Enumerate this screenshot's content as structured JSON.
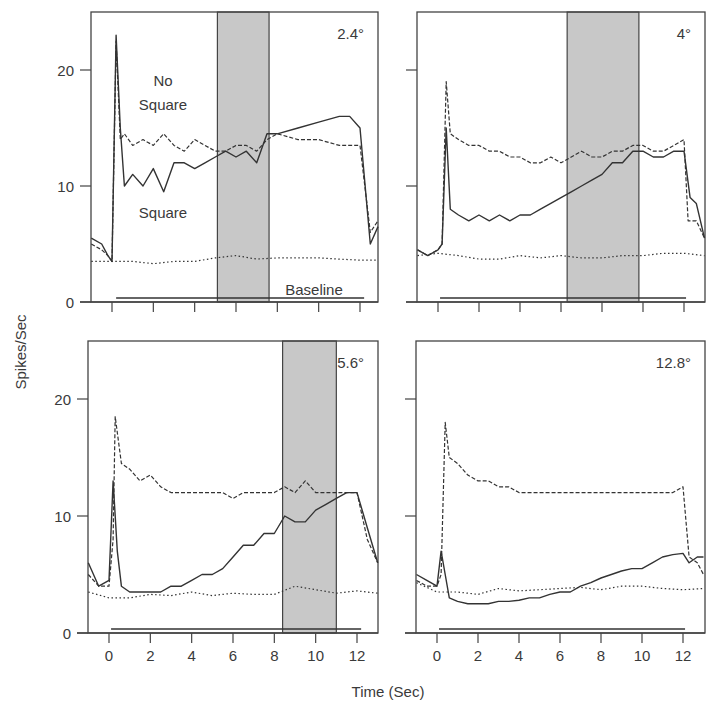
{
  "figure": {
    "ylabel": "Spikes/Sec",
    "xlabel": "Time (Sec)",
    "colors": {
      "line": "#333333",
      "shade": "#c8c8c8",
      "frame": "#444444"
    }
  },
  "chart_data": [
    {
      "type": "line",
      "title": "2.4°",
      "xlabel": "Time (Sec)",
      "ylabel": "Spikes/Sec",
      "xlim": [
        -1,
        13
      ],
      "ylim": [
        0,
        25
      ],
      "xticks": [
        0,
        2,
        4,
        6,
        8,
        10,
        12
      ],
      "yticks": [
        0,
        10,
        20
      ],
      "shaded_interval": [
        5.1,
        7.6
      ],
      "stimulus_bar": [
        0.2,
        12.2
      ],
      "annotations": [
        "No Square",
        "Square",
        "Baseline"
      ],
      "series": [
        {
          "name": "No Square",
          "style": "dashed",
          "x": [
            -1,
            -0.5,
            -0.2,
            0,
            0.2,
            0.4,
            0.6,
            1,
            1.5,
            2,
            2.5,
            3,
            3.5,
            4,
            4.5,
            5,
            5.5,
            6,
            6.5,
            7,
            7.5,
            8,
            9,
            10,
            11,
            12,
            12.5,
            13
          ],
          "y": [
            5,
            4.5,
            4,
            3.5,
            22.5,
            14,
            14.5,
            13.5,
            14,
            13.5,
            14.5,
            13.5,
            13,
            14,
            13.5,
            13,
            13,
            13.5,
            13.5,
            13,
            14,
            14.5,
            14,
            14,
            13.5,
            13.5,
            6,
            7
          ]
        },
        {
          "name": "Square",
          "style": "solid",
          "x": [
            -1,
            -0.5,
            -0.2,
            0,
            0.2,
            0.4,
            0.6,
            1,
            1.5,
            2,
            2.5,
            3,
            3.5,
            4,
            4.5,
            5,
            5.5,
            6,
            6.5,
            7,
            7.5,
            8,
            9,
            10,
            11,
            11.5,
            12,
            12.5,
            13
          ],
          "y": [
            5.5,
            5,
            4,
            3.5,
            23,
            15,
            10,
            11,
            10,
            11.5,
            9.5,
            12,
            12,
            11.5,
            12,
            12.5,
            13,
            12.5,
            13,
            12,
            14.5,
            14.5,
            15,
            15.5,
            16,
            16,
            15,
            5,
            6.5
          ]
        },
        {
          "name": "Baseline",
          "style": "dotted",
          "x": [
            -1,
            0,
            1,
            2,
            3,
            4,
            5,
            6,
            7,
            8,
            9,
            10,
            11,
            12,
            13
          ],
          "y": [
            3.5,
            3.5,
            3.5,
            3.3,
            3.5,
            3.5,
            3.8,
            4,
            3.7,
            3.8,
            3.8,
            3.8,
            3.7,
            3.6,
            3.6
          ]
        }
      ]
    },
    {
      "type": "line",
      "title": "4°",
      "xlim": [
        -1,
        13
      ],
      "ylim": [
        0,
        25
      ],
      "xticks": [
        0,
        2,
        4,
        6,
        8,
        10,
        12
      ],
      "yticks": [
        0,
        10,
        20
      ],
      "shaded_interval": [
        6.3,
        9.8
      ],
      "stimulus_bar": [
        0.1,
        12.1
      ],
      "series": [
        {
          "name": "No Square",
          "style": "dashed",
          "x": [
            -1,
            -0.5,
            0,
            0.2,
            0.4,
            0.6,
            1,
            1.5,
            2,
            2.5,
            3,
            3.5,
            4,
            4.5,
            5,
            5.5,
            6,
            6.5,
            7,
            7.5,
            8,
            8.5,
            9,
            9.5,
            10,
            10.5,
            11,
            11.5,
            12,
            12.2,
            12.6,
            13
          ],
          "y": [
            4.5,
            4,
            4.5,
            5,
            19,
            14.5,
            14,
            13.5,
            13.5,
            13,
            13,
            12.5,
            12.5,
            12,
            12,
            12.5,
            12,
            12.5,
            13,
            12.5,
            12.5,
            13,
            13,
            13.5,
            13.5,
            13,
            13,
            13.5,
            14,
            7,
            7,
            5.5
          ]
        },
        {
          "name": "Square",
          "style": "solid",
          "x": [
            -1,
            -0.5,
            0,
            0.2,
            0.4,
            0.6,
            1,
            1.5,
            2,
            2.5,
            3,
            3.5,
            4,
            4.5,
            5,
            5.5,
            6,
            6.5,
            7,
            7.5,
            8,
            8.5,
            9,
            9.5,
            10,
            10.5,
            11,
            11.5,
            12,
            12.3,
            12.6,
            13
          ],
          "y": [
            4.5,
            4,
            4.5,
            5,
            15,
            8,
            7.5,
            7,
            7.5,
            7,
            7.5,
            7,
            7.5,
            7.5,
            8,
            8.5,
            9,
            9.5,
            10,
            10.5,
            11,
            12,
            12,
            13,
            13,
            12.5,
            12.5,
            13,
            13,
            9,
            8.5,
            5.5
          ]
        },
        {
          "name": "Baseline",
          "style": "dotted",
          "x": [
            -1,
            0,
            1,
            2,
            3,
            4,
            5,
            6,
            7,
            8,
            9,
            10,
            11,
            12,
            13
          ],
          "y": [
            4,
            4.2,
            4,
            3.7,
            3.7,
            4,
            3.8,
            4,
            3.8,
            3.8,
            4,
            4,
            4.2,
            4.2,
            4
          ]
        }
      ]
    },
    {
      "type": "line",
      "title": "5.6°",
      "xlim": [
        -1,
        13
      ],
      "ylim": [
        0,
        25
      ],
      "xticks": [
        0,
        2,
        4,
        6,
        8,
        10,
        12
      ],
      "yticks": [
        0,
        10,
        20
      ],
      "shaded_interval": [
        8.4,
        11.0
      ],
      "stimulus_bar": [
        0.1,
        12.2
      ],
      "series": [
        {
          "name": "No Square",
          "style": "dashed",
          "x": [
            -1,
            -0.5,
            0,
            0.2,
            0.3,
            0.6,
            1,
            1.5,
            2,
            2.5,
            3,
            3.5,
            4,
            4.5,
            5,
            5.5,
            6,
            6.5,
            7,
            7.5,
            8,
            8.5,
            9,
            9.5,
            10,
            10.5,
            11,
            11.5,
            12,
            12.5,
            13
          ],
          "y": [
            5,
            4,
            4,
            8,
            18.5,
            14.5,
            14,
            13,
            13.5,
            12.5,
            12,
            12,
            12,
            12,
            12,
            12,
            11.5,
            12,
            12,
            12,
            12,
            12.5,
            12,
            13,
            12,
            12,
            12,
            12,
            12,
            8,
            6
          ]
        },
        {
          "name": "Square",
          "style": "solid",
          "x": [
            -1,
            -0.5,
            0,
            0.2,
            0.4,
            0.6,
            1,
            1.5,
            2,
            2.5,
            3,
            3.5,
            4,
            4.5,
            5,
            5.5,
            6,
            6.5,
            7,
            7.5,
            8,
            8.5,
            9,
            9.5,
            10,
            10.5,
            11,
            11.5,
            12,
            12.5,
            13
          ],
          "y": [
            6,
            4,
            4.5,
            13,
            7,
            4,
            3.5,
            3.5,
            3.5,
            3.5,
            4,
            4,
            4.5,
            5,
            5,
            5.5,
            6.5,
            7.5,
            7.5,
            8.5,
            8.5,
            10,
            9.5,
            9.5,
            10.5,
            11,
            11.5,
            12,
            12,
            9,
            6
          ]
        },
        {
          "name": "Baseline",
          "style": "dotted",
          "x": [
            -1,
            0,
            1,
            2,
            3,
            4,
            5,
            6,
            7,
            8,
            9,
            10,
            11,
            12,
            13
          ],
          "y": [
            3.5,
            3,
            3,
            3.3,
            3.2,
            3.5,
            3.2,
            3.4,
            3.3,
            3.3,
            4,
            3.7,
            3.4,
            3.6,
            3.4
          ]
        }
      ]
    },
    {
      "type": "line",
      "title": "12.8°",
      "xlim": [
        -1,
        13
      ],
      "ylim": [
        0,
        25
      ],
      "xticks": [
        0,
        2,
        4,
        6,
        8,
        10,
        12
      ],
      "yticks": [
        0,
        10,
        20
      ],
      "stimulus_bar": [
        0.1,
        12.1
      ],
      "series": [
        {
          "name": "No Square",
          "style": "dashed",
          "x": [
            -1,
            -0.5,
            0,
            0.2,
            0.4,
            0.6,
            1,
            1.5,
            2,
            2.5,
            3,
            3.5,
            4,
            4.5,
            5,
            5.5,
            6,
            6.5,
            7,
            7.5,
            8,
            8.5,
            9,
            9.5,
            10,
            10.5,
            11,
            11.5,
            12,
            12.3,
            12.7,
            13
          ],
          "y": [
            4.5,
            4,
            4,
            5,
            18,
            15,
            14.5,
            13.5,
            13,
            13,
            12.5,
            12.5,
            12,
            12,
            12,
            12,
            12,
            12,
            12,
            12,
            12,
            12,
            12,
            12,
            12,
            12,
            12,
            12,
            12.5,
            6.5,
            6,
            5
          ]
        },
        {
          "name": "Square",
          "style": "solid",
          "x": [
            -1,
            -0.5,
            0,
            0.2,
            0.4,
            0.6,
            1,
            1.5,
            2,
            2.5,
            3,
            3.5,
            4,
            4.5,
            5,
            5.5,
            6,
            6.5,
            7,
            7.5,
            8,
            8.5,
            9,
            9.5,
            10,
            10.5,
            11,
            11.5,
            12,
            12.3,
            12.7,
            13
          ],
          "y": [
            5,
            4.5,
            4,
            7,
            5,
            3,
            2.7,
            2.5,
            2.5,
            2.5,
            2.7,
            2.7,
            2.8,
            3,
            3,
            3.3,
            3.5,
            3.5,
            4,
            4.3,
            4.7,
            5,
            5.3,
            5.5,
            5.5,
            6,
            6.5,
            6.7,
            6.8,
            6,
            6.5,
            6.5
          ]
        },
        {
          "name": "Baseline",
          "style": "dotted",
          "x": [
            -1,
            0,
            1,
            2,
            3,
            4,
            5,
            6,
            7,
            8,
            9,
            10,
            11,
            12,
            13
          ],
          "y": [
            4.3,
            3.5,
            3.5,
            3.3,
            3.8,
            3.6,
            3.7,
            3.8,
            3.9,
            3.7,
            4,
            4,
            3.8,
            3.7,
            3.8
          ]
        }
      ]
    }
  ]
}
